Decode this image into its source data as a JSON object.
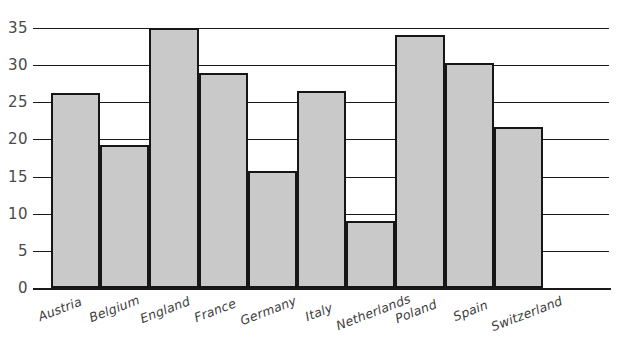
{
  "chart_data": {
    "type": "bar",
    "title": "",
    "subtitle": "",
    "xlabel": "",
    "ylabel": "",
    "categories": [
      "Austria",
      "Belgium",
      "England",
      "France",
      "Germany",
      "Italy",
      "Netherlands",
      "Poland",
      "Spain",
      "Switzerland"
    ],
    "values": [
      26.2,
      19.2,
      35.0,
      29.0,
      15.8,
      26.5,
      9.0,
      34.1,
      30.3,
      21.7
    ],
    "ylim": [
      0,
      35
    ],
    "ytick_labels": [
      "0",
      "5",
      "10",
      "15",
      "20",
      "25",
      "30",
      "35"
    ],
    "ytick_values": [
      0,
      5,
      10,
      15,
      20,
      25,
      30,
      35
    ],
    "grid": true,
    "grid_axis": "y",
    "legend": false,
    "legend_position": "none",
    "bar_fill_color": "#c9c9c9",
    "bar_edge_color": "#161616",
    "axis_color": "#1a1a1a",
    "tick_label_color": "#4a4a4a",
    "category_label_color": "#3d3d3d",
    "background_color": "#ffffff",
    "category_label_rotation": -21
  }
}
